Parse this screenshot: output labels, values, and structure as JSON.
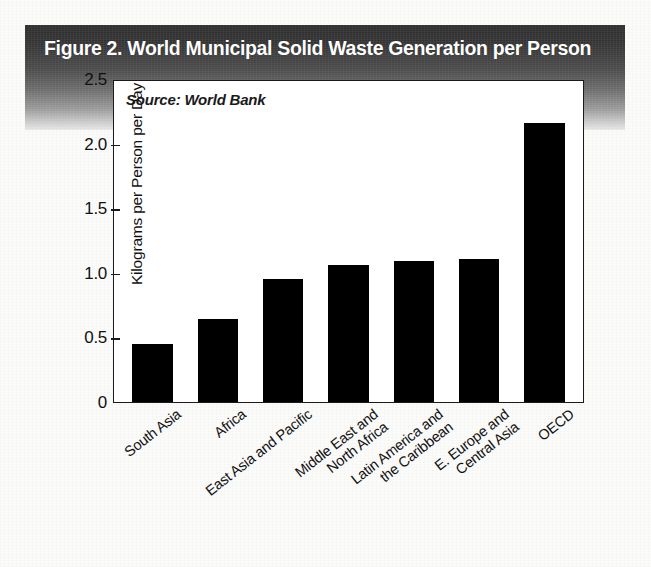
{
  "figure": {
    "title": "Figure 2. World Municipal Solid Waste Generation per Person",
    "source_note": "Source: World Bank"
  },
  "chart_data": {
    "type": "bar",
    "title": "Figure 2. World Municipal Solid Waste Generation per Person",
    "subtitle": "",
    "xlabel": "",
    "ylabel": "Kilograms per Person per Day",
    "annotation": "Source: World Bank",
    "grid": false,
    "legend": "none",
    "ylim": [
      0,
      2.5
    ],
    "ytick_labels": [
      "0",
      "0.5",
      "1.0",
      "1.5",
      "2.0",
      "2.5"
    ],
    "ytick_values": [
      0,
      0.5,
      1.0,
      1.5,
      2.0,
      2.5
    ],
    "categories": [
      "South Asia",
      "Africa",
      "East Asia and Pacific",
      "Middle East and\nNorth Africa",
      "Latin America and\nthe Caribbean",
      "E. Europe and\nCentral Asia",
      "OECD"
    ],
    "category_lines": [
      [
        "South Asia"
      ],
      [
        "Africa"
      ],
      [
        "East Asia and Pacific"
      ],
      [
        "Middle East and",
        "North Africa"
      ],
      [
        "Latin America and",
        "the Caribbean"
      ],
      [
        "E. Europe and",
        "Central Asia"
      ],
      [
        "OECD"
      ]
    ],
    "values": [
      0.45,
      0.64,
      0.95,
      1.06,
      1.09,
      1.11,
      2.16
    ],
    "bar_color": "#000000",
    "plot_background": "#ffffff"
  },
  "colors": {
    "header_band_dark": "#2c2c2c",
    "header_band_light": "#e6e6e4",
    "title_text": "#ffffff",
    "axis": "#1a1a1a",
    "bar": "#000000",
    "page": "#fbfbfa"
  }
}
